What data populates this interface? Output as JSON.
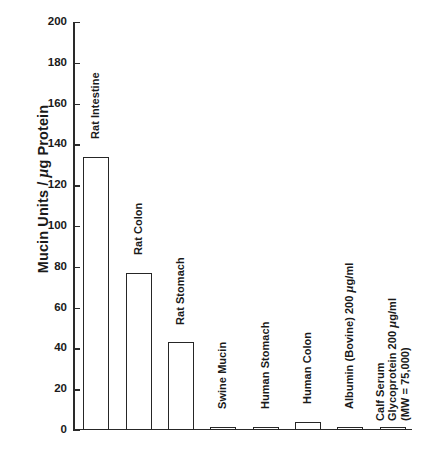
{
  "chart_data": {
    "type": "bar",
    "title": "",
    "xlabel": "",
    "ylabel": "Mucin Units / μg Protein",
    "ylim": [
      0,
      200
    ],
    "yticks": [
      0,
      20,
      40,
      60,
      80,
      100,
      120,
      140,
      160,
      180,
      200
    ],
    "grid": false,
    "legend": "none",
    "categories": [
      "Rat Intestine",
      "Rat Colon",
      "Rat Stomach",
      "Swine Mucin",
      "Human Stomach",
      "Human Colon",
      "Albumin (Bovine) 200 μg/ml",
      "Calf Serum Glycoprotein 200 μg/ml (MW = 75,000)"
    ],
    "values": [
      134,
      77,
      43,
      1,
      1,
      4,
      1,
      0.5
    ]
  },
  "axis": {
    "y_title_pre": "Mucin Units / ",
    "y_title_mu": "μ",
    "y_title_post": "g Protein",
    "tick_labels": [
      "0",
      "20",
      "40",
      "60",
      "80",
      "100",
      "120",
      "140",
      "160",
      "180",
      "200"
    ]
  },
  "bars": [
    {
      "label": "Rat Intestine",
      "value": 134,
      "label_lines": [
        {
          "pre": "Rat Intestine",
          "mu": "",
          "post": ""
        }
      ]
    },
    {
      "label": "Rat Colon",
      "value": 77,
      "label_lines": [
        {
          "pre": "Rat Colon",
          "mu": "",
          "post": ""
        }
      ]
    },
    {
      "label": "Rat Stomach",
      "value": 43,
      "label_lines": [
        {
          "pre": "Rat Stomach",
          "mu": "",
          "post": ""
        }
      ]
    },
    {
      "label": "Swine Mucin",
      "value": 1,
      "label_lines": [
        {
          "pre": "Swine Mucin",
          "mu": "",
          "post": ""
        }
      ]
    },
    {
      "label": "Human Stomach",
      "value": 1,
      "label_lines": [
        {
          "pre": "Human Stomach",
          "mu": "",
          "post": ""
        }
      ]
    },
    {
      "label": "Human Colon",
      "value": 4,
      "label_lines": [
        {
          "pre": "Human Colon",
          "mu": "",
          "post": ""
        }
      ]
    },
    {
      "label": "Albumin (Bovine) 200 μg/ml",
      "value": 1,
      "label_lines": [
        {
          "pre": "Albumin (Bovine) 200 ",
          "mu": "μ",
          "post": "g/ml"
        }
      ]
    },
    {
      "label": "Calf Serum Glycoprotein 200 μg/ml (MW = 75,000)",
      "value": 0.5,
      "label_lines": [
        {
          "pre": "Calf Serum",
          "mu": "",
          "post": ""
        },
        {
          "pre": "Glycoprotein 200 ",
          "mu": "μ",
          "post": "g/ml"
        },
        {
          "pre": "(MW = 75,000)",
          "mu": "",
          "post": ""
        }
      ]
    }
  ],
  "colors": {
    "axis": "#2a2a2a",
    "bar_stroke": "#262626",
    "bar_fill": "#ffffff",
    "text": "#1a1a1a",
    "background": "#ffffff"
  }
}
